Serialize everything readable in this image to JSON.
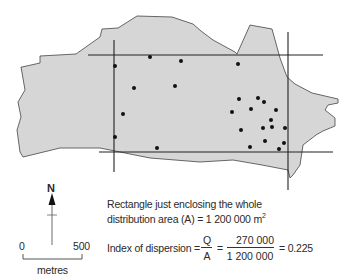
{
  "map": {
    "fill_color": "#d6d6d6",
    "outline_color": "#444444",
    "polygon": [
      [
        22,
        67
      ],
      [
        40,
        63
      ],
      [
        40,
        56
      ],
      [
        76,
        54
      ],
      [
        100,
        37
      ],
      [
        102,
        29
      ],
      [
        118,
        28
      ],
      [
        137,
        16
      ],
      [
        172,
        17
      ],
      [
        193,
        24
      ],
      [
        201,
        31
      ],
      [
        213,
        40
      ],
      [
        235,
        52
      ],
      [
        237,
        54
      ],
      [
        250,
        25
      ],
      [
        272,
        29
      ],
      [
        280,
        58
      ],
      [
        287,
        77
      ],
      [
        295,
        84
      ],
      [
        312,
        93
      ],
      [
        338,
        99
      ],
      [
        338,
        103
      ],
      [
        328,
        105
      ],
      [
        325,
        110
      ],
      [
        335,
        118
      ],
      [
        335,
        126
      ],
      [
        323,
        131
      ],
      [
        316,
        135
      ],
      [
        303,
        145
      ],
      [
        300,
        165
      ],
      [
        293,
        175
      ],
      [
        290,
        178
      ],
      [
        288,
        170
      ],
      [
        262,
        165
      ],
      [
        233,
        160
      ],
      [
        200,
        162
      ],
      [
        150,
        158
      ],
      [
        100,
        148
      ],
      [
        60,
        148
      ],
      [
        23,
        157
      ],
      [
        20,
        152
      ],
      [
        17,
        130
      ],
      [
        21,
        117
      ],
      [
        18,
        102
      ],
      [
        25,
        90
      ],
      [
        21,
        67
      ]
    ],
    "rectangle_lines": {
      "top": {
        "x1": 88,
        "y1": 55,
        "x2": 323,
        "y2": 55
      },
      "bottom": {
        "x1": 99,
        "y1": 152,
        "x2": 333,
        "y2": 152
      },
      "left": {
        "x1": 114,
        "y1": 40,
        "x2": 114,
        "y2": 172
      },
      "right": {
        "x1": 288,
        "y1": 32,
        "x2": 288,
        "y2": 190
      }
    },
    "points": [
      [
        150,
        57
      ],
      [
        181,
        61
      ],
      [
        238,
        64
      ],
      [
        115,
        66
      ],
      [
        134,
        88
      ],
      [
        175,
        86
      ],
      [
        239,
        99
      ],
      [
        258,
        98
      ],
      [
        264,
        102
      ],
      [
        232,
        112
      ],
      [
        251,
        109
      ],
      [
        276,
        110
      ],
      [
        123,
        114
      ],
      [
        271,
        120
      ],
      [
        241,
        130
      ],
      [
        263,
        128
      ],
      [
        272,
        127
      ],
      [
        285,
        128
      ],
      [
        115,
        137
      ],
      [
        265,
        141
      ],
      [
        284,
        143
      ],
      [
        157,
        148
      ],
      [
        250,
        147
      ],
      [
        279,
        149
      ]
    ]
  },
  "north_arrow": {
    "label": "N"
  },
  "scale_bar": {
    "start": "0",
    "end": "500",
    "unit": "metres"
  },
  "annotation": {
    "line1": "Rectangle just enclosing the whole",
    "line2_prefix": "distribution area (A) = 1 200 000 m",
    "line2_sup": "2"
  },
  "formula": {
    "label": "Index of dispersion =",
    "q": "Q",
    "a": "A",
    "eq": "=",
    "numerator": "270 000",
    "denominator": "1 200 000",
    "result": "= 0.225"
  }
}
